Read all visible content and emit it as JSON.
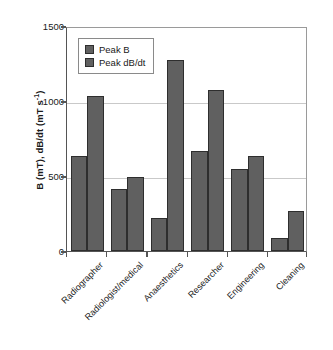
{
  "chart_data": {
    "type": "bar",
    "title": "",
    "subtitle": "",
    "xlabel": "",
    "ylabel": "B (mT), dB/dt (mT s⁻¹)",
    "ylabel_parts": {
      "main": "B (mT), dB/dt (mT s",
      "exponent": "-1",
      "tail": ")"
    },
    "categories": [
      "Radiographer",
      "Radiologist/medical",
      "Anaesthetics",
      "Researcher",
      "Engineering",
      "Cleaning"
    ],
    "series": [
      {
        "name": "Peak B",
        "color": "#606060",
        "values": [
          635,
          415,
          220,
          670,
          545,
          85
        ]
      },
      {
        "name": "Peak dB/dt",
        "color": "#606060",
        "values": [
          1035,
          495,
          1275,
          1075,
          635,
          265
        ]
      }
    ],
    "ylim": [
      0,
      1500
    ],
    "ytick_values": [
      0,
      500,
      1000,
      1500
    ],
    "ytick_labels": [
      "0",
      "500",
      "1000",
      "1500"
    ],
    "grid": true,
    "grid_axis": "y",
    "legend_position": "upper left inside",
    "bar_edge_color": "#2e2e2e",
    "axis_color": "#555555",
    "gridline_color": "#c9c9c9",
    "background_color": "#ffffff",
    "xtick_label_rotation": -45
  },
  "legend": {
    "entries": [
      {
        "label": "Peak B",
        "swatch_color": "#606060"
      },
      {
        "label": "Peak dB/dt",
        "swatch_color": "#606060"
      }
    ]
  }
}
